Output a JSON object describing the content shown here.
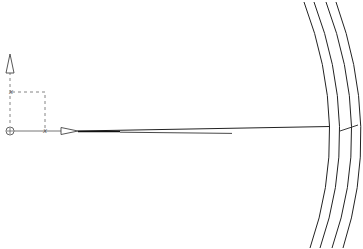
{
  "canvas": {
    "background": "#ffffff",
    "line_color": "#222222",
    "construction_color": "#777777"
  },
  "ucs_icon": {
    "origin_symbol": "⊕",
    "x_label": "x",
    "y_label": "x"
  },
  "arcs": {
    "count": 4
  }
}
